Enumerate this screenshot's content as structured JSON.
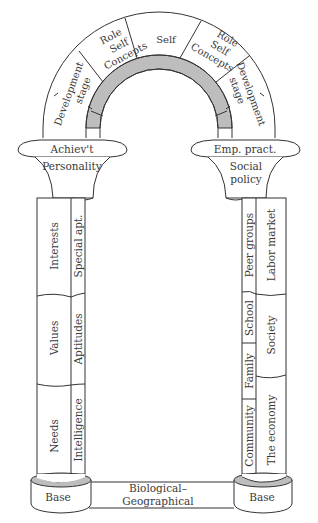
{
  "diagram": {
    "arch": {
      "segments": [
        {
          "id": "dev-left",
          "label_lines": [
            "Development",
            "stage"
          ]
        },
        {
          "id": "role-left",
          "label_lines": [
            "Role",
            "Self",
            "Concepts"
          ]
        },
        {
          "id": "self",
          "label_lines": [
            "Self"
          ]
        },
        {
          "id": "role-right",
          "label_lines": [
            "Role",
            "Self",
            "Concepts"
          ]
        },
        {
          "id": "dev-right",
          "label_lines": [
            "Development",
            "stage"
          ]
        }
      ],
      "band_color": "#bdbdbd"
    },
    "left_pillar": {
      "capital_top": "Achiev't",
      "capital": "Personality",
      "outer_column": [
        "Interests",
        "Values",
        "Needs"
      ],
      "inner_column": [
        "Special apt.",
        "Aptitudes",
        "Intelligence"
      ],
      "base": "Base"
    },
    "right_pillar": {
      "capital_top": "Emp. pract.",
      "capital_lines": [
        "Social",
        "policy"
      ],
      "inner_column": [
        "Peer groups",
        "School",
        "Family",
        "Community"
      ],
      "outer_column": [
        "Labor market",
        "Society",
        "The economy"
      ],
      "base": "Base"
    },
    "foundation": {
      "label_lines": [
        "Biological–",
        "Geographical"
      ]
    },
    "colors": {
      "stroke": "#333333",
      "shade": "#bdbdbd",
      "text": "#3a3a3a"
    }
  }
}
